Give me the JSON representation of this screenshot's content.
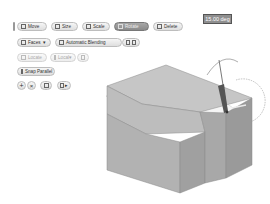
{
  "toolbar": {
    "row1": [
      {
        "label": "Move",
        "icon": "move-icon"
      },
      {
        "label": "Size",
        "icon": "size-icon"
      },
      {
        "label": "Scale",
        "icon": "scale-icon"
      },
      {
        "label": "Rotate",
        "icon": "rotate-icon",
        "active": true
      },
      {
        "label": "Delete",
        "icon": "delete-icon"
      }
    ],
    "row2": {
      "faces_label": "Faces",
      "blending_label": "Automatic Blending",
      "extra_icon": "options-icon"
    },
    "row3": {
      "locate_label": "Locate",
      "local_label": "Local",
      "disabled": true
    },
    "row4": {
      "snap_label": "Snap Parallel"
    },
    "row5": {
      "ok_icon": "plus-icon",
      "cancel_icon": "x-icon",
      "help_icon": "help-icon",
      "menu_icon": "menu-icon"
    }
  },
  "rotation_value": "15.00 deg",
  "colors": {
    "model_top": "#c4c4c4",
    "model_front": "#b0b0b0",
    "model_side": "#9c9c9c",
    "active_button": "#999999"
  }
}
